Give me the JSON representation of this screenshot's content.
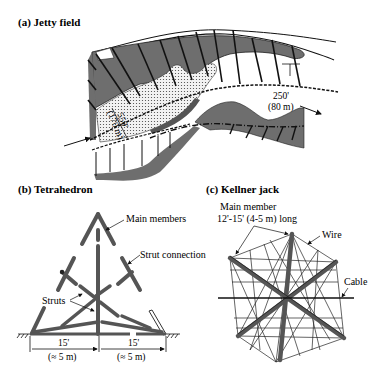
{
  "figure": {
    "panels": [
      {
        "id": "a",
        "title": "(a) Jetty field",
        "annotations": {
          "spacing_ft": "250'",
          "spacing_m": "(80 m)",
          "length_ft": "550'",
          "length_m": "(170 m)"
        }
      },
      {
        "id": "b",
        "title": "(b) Tetrahedron",
        "labels": {
          "main_members": "Main members",
          "strut_connection": "Strut connection",
          "struts": "Struts",
          "dim_left_ft": "15'",
          "dim_left_m": "(≈ 5 m)",
          "dim_right_ft": "15'",
          "dim_right_m": "(≈ 5 m)"
        }
      },
      {
        "id": "c",
        "title": "(c) Kellner jack",
        "labels": {
          "main_member_line1": "Main member",
          "main_member_line2": "12'-15' (4-5 m) long",
          "wire": "Wire",
          "cable": "Cable"
        }
      }
    ],
    "colors": {
      "fill_dark": "#707070",
      "stroke": "#111111",
      "background": "#ffffff"
    }
  }
}
